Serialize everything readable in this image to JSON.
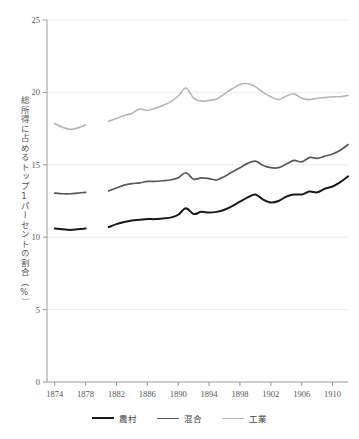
{
  "chart_data": {
    "type": "line",
    "title": "",
    "xlabel": "",
    "ylabel": "総所得に占めるトップ1パーセントの割合（%）",
    "xlim": [
      1873,
      1912
    ],
    "ylim": [
      0,
      25
    ],
    "xticks": [
      1874,
      1878,
      1882,
      1886,
      1890,
      1894,
      1898,
      1902,
      1906,
      1910
    ],
    "yticks": [
      0,
      5,
      10,
      15,
      20,
      25
    ],
    "grid": true,
    "legend_position": "bottom",
    "series": [
      {
        "name": "農村",
        "color": "#1a1a1a",
        "width": 2.0,
        "segments": [
          {
            "x": [
              1874,
              1875,
              1876,
              1877,
              1878
            ],
            "y": [
              10.6,
              10.55,
              10.5,
              10.55,
              10.6
            ]
          },
          {
            "x": [
              1881,
              1882,
              1883,
              1884,
              1885,
              1886,
              1887,
              1888,
              1889,
              1890,
              1891,
              1892,
              1893,
              1894,
              1895,
              1896,
              1897,
              1898,
              1899,
              1900,
              1901,
              1902,
              1903,
              1904,
              1905,
              1906,
              1907,
              1908,
              1909,
              1910,
              1911,
              1912
            ],
            "y": [
              10.7,
              10.9,
              11.05,
              11.15,
              11.2,
              11.25,
              11.25,
              11.3,
              11.35,
              11.55,
              12.0,
              11.6,
              11.75,
              11.7,
              11.75,
              11.9,
              12.15,
              12.45,
              12.75,
              12.95,
              12.6,
              12.4,
              12.5,
              12.8,
              12.95,
              12.95,
              13.15,
              13.1,
              13.35,
              13.5,
              13.8,
              14.2
            ]
          }
        ]
      },
      {
        "name": "混合",
        "color": "#5a5a5a",
        "width": 1.7,
        "segments": [
          {
            "x": [
              1874,
              1875,
              1876,
              1877,
              1878
            ],
            "y": [
              13.05,
              13.0,
              13.0,
              13.05,
              13.1
            ]
          },
          {
            "x": [
              1881,
              1882,
              1883,
              1884,
              1885,
              1886,
              1887,
              1888,
              1889,
              1890,
              1891,
              1892,
              1893,
              1894,
              1895,
              1896,
              1897,
              1898,
              1899,
              1900,
              1901,
              1902,
              1903,
              1904,
              1905,
              1906,
              1907,
              1908,
              1909,
              1910,
              1911,
              1912
            ],
            "y": [
              13.2,
              13.4,
              13.6,
              13.7,
              13.75,
              13.85,
              13.85,
              13.9,
              13.95,
              14.1,
              14.45,
              14.0,
              14.1,
              14.05,
              13.95,
              14.2,
              14.5,
              14.8,
              15.1,
              15.25,
              14.95,
              14.8,
              14.8,
              15.05,
              15.3,
              15.2,
              15.5,
              15.45,
              15.6,
              15.75,
              16.0,
              16.4
            ]
          }
        ]
      },
      {
        "name": "工業",
        "color": "#b5b5b5",
        "width": 1.6,
        "segments": [
          {
            "x": [
              1874,
              1875,
              1876,
              1877,
              1878
            ],
            "y": [
              17.85,
              17.6,
              17.45,
              17.55,
              17.75
            ]
          },
          {
            "x": [
              1881,
              1882,
              1883,
              1884,
              1885,
              1886,
              1887,
              1888,
              1889,
              1890,
              1891,
              1892,
              1893,
              1894,
              1895,
              1896,
              1897,
              1898,
              1899,
              1900,
              1901,
              1902,
              1903,
              1904,
              1905,
              1906,
              1907,
              1908,
              1909,
              1910,
              1911,
              1912
            ],
            "y": [
              18.0,
              18.2,
              18.4,
              18.55,
              18.85,
              18.75,
              18.9,
              19.1,
              19.35,
              19.75,
              20.3,
              19.6,
              19.4,
              19.45,
              19.55,
              19.9,
              20.25,
              20.55,
              20.6,
              20.4,
              20.0,
              19.7,
              19.5,
              19.75,
              19.9,
              19.6,
              19.5,
              19.6,
              19.65,
              19.7,
              19.7,
              19.8
            ]
          }
        ]
      }
    ]
  },
  "axis": {
    "y_title": "総所得に占めるトップ1パーセントの割合（%）"
  },
  "legend": {
    "items": [
      {
        "label": "農村",
        "color": "#1a1a1a"
      },
      {
        "label": "混合",
        "color": "#5a5a5a"
      },
      {
        "label": "工業",
        "color": "#b5b5b5"
      }
    ]
  },
  "colors": {
    "background": "#ffffff",
    "grid": "#ededed",
    "axis": "#9a9a9a",
    "text": "#555555"
  }
}
